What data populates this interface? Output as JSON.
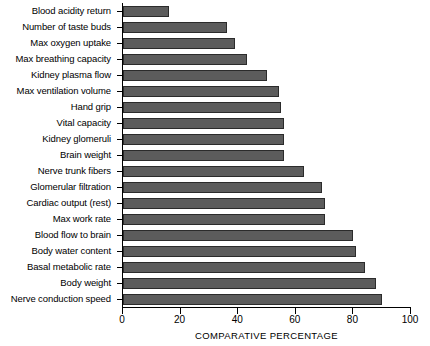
{
  "chart_data": {
    "type": "bar",
    "orientation": "horizontal",
    "title": "",
    "xlabel": "COMPARATIVE PERCENTAGE",
    "ylabel": "",
    "xlim": [
      0,
      100
    ],
    "xticks": [
      0,
      20,
      40,
      60,
      80,
      100
    ],
    "xtick_labels": [
      "0",
      "20",
      "40",
      "60",
      "80",
      "100"
    ],
    "grid": false,
    "legend": false,
    "bar_color": "#5c5c5c",
    "bar_edge_color": "#2b2b2b",
    "axis_color": "#000000",
    "categories": [
      "Blood acidity return",
      "Number of taste buds",
      "Max oxygen uptake",
      "Max breathing capacity",
      "Kidney plasma flow",
      "Max ventilation volume",
      "Hand grip",
      "Vital capacity",
      "Kidney glomeruli",
      "Brain weight",
      "Nerve trunk fibers",
      "Glomerular filtration",
      "Cardiac output (rest)",
      "Max work rate",
      "Blood flow to brain",
      "Body water content",
      "Basal metabolic rate",
      "Body weight",
      "Nerve conduction speed"
    ],
    "values": [
      16,
      36,
      39,
      43,
      50,
      54,
      55,
      56,
      56,
      56,
      63,
      69,
      70,
      70,
      80,
      81,
      84,
      88,
      90
    ]
  }
}
